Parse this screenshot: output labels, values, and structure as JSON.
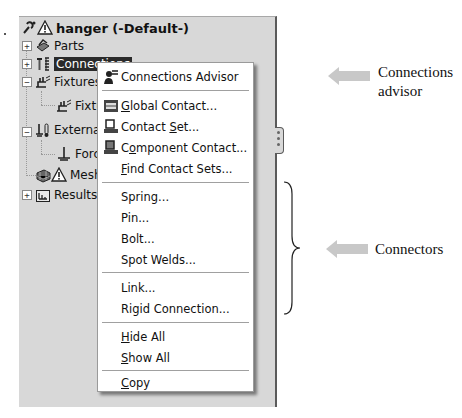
{
  "tree": {
    "root": {
      "label": "hanger (-Default-)",
      "icon": "study-warning-icon"
    },
    "items": [
      {
        "label": "Parts",
        "icon": "parts-icon",
        "expander": "+"
      },
      {
        "label": "Connections",
        "icon": "connections-icon",
        "expander": "+",
        "selected": true
      },
      {
        "label": "Fixtures",
        "icon": "fixtures-icon",
        "expander": "−"
      },
      {
        "label": "Fixture-1",
        "icon": "fixture-icon"
      },
      {
        "label": "External Loads",
        "icon": "external-loads-icon",
        "expander": "−"
      },
      {
        "label": "Force-1",
        "icon": "force-icon"
      },
      {
        "label": "Mesh",
        "icon": "mesh-warning-icon"
      },
      {
        "label": "Results",
        "icon": "results-folder-icon",
        "expander": "+"
      }
    ]
  },
  "context_menu": {
    "items": [
      {
        "label": "Connections Advisor",
        "icon": "connections-advisor-icon"
      },
      {
        "label": "Global Contact...",
        "mnemonic": "G",
        "icon": "global-contact-icon"
      },
      {
        "label": "Contact Set...",
        "mnemonic": "S",
        "icon": "contact-set-icon"
      },
      {
        "label": "Component Contact...",
        "mnemonic": "o",
        "icon": "component-contact-icon"
      },
      {
        "label": "Find Contact Sets...",
        "mnemonic": "F"
      },
      {
        "label": "Spring..."
      },
      {
        "label": "Pin..."
      },
      {
        "label": "Bolt..."
      },
      {
        "label": "Spot Welds..."
      },
      {
        "label": "Link..."
      },
      {
        "label": "Rigid Connection..."
      },
      {
        "label": "Hide All",
        "mnemonic": "H"
      },
      {
        "label": "Show All",
        "mnemonic": "S"
      },
      {
        "label": "Copy",
        "mnemonic": "C"
      }
    ]
  },
  "annotations": {
    "advisor_line1": "Connections",
    "advisor_line2": "advisor",
    "connectors": "Connectors",
    "arrow_color": "#c8c8c8"
  },
  "colors": {
    "panel_bg": "#d8d8d8",
    "menu_bg": "#ffffff",
    "selected_bg": "#2a2a2a"
  }
}
